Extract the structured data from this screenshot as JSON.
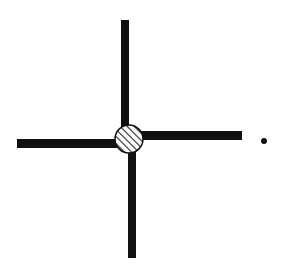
{
  "diagram": {
    "colors": {
      "bar": "#111111",
      "node_fill": "#ffffff",
      "hatch": "#222222",
      "dot": "#111111",
      "background": "#ffffff"
    },
    "bars": [
      {
        "name": "top-bar",
        "x": 121,
        "y": 20,
        "width": 8,
        "height": 112
      },
      {
        "name": "bottom-bar",
        "x": 128,
        "y": 146,
        "width": 8,
        "height": 112
      },
      {
        "name": "left-bar",
        "x": 17,
        "y": 139,
        "width": 104,
        "height": 9
      },
      {
        "name": "right-bar",
        "x": 136,
        "y": 131,
        "width": 106,
        "height": 9
      }
    ],
    "node": {
      "cx": 129,
      "cy": 139,
      "r": 14,
      "pattern": "diagonal-hatch"
    },
    "dot": {
      "cx": 264,
      "cy": 141,
      "r": 3
    }
  }
}
